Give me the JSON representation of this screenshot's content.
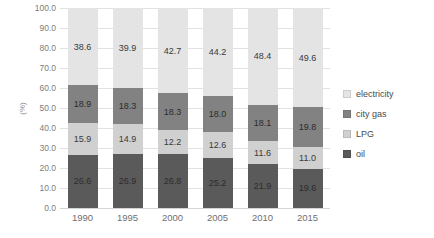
{
  "chart_data": {
    "type": "bar",
    "subtype": "stacked-bar-100",
    "title": "",
    "xlabel": "",
    "ylabel": "(%)",
    "ylim": [
      0,
      100
    ],
    "ytick_labels": [
      "0.0",
      "10.0",
      "20.0",
      "30.0",
      "40.0",
      "50.0",
      "60.0",
      "70.0",
      "80.0",
      "90.0",
      "100.0"
    ],
    "ytick_values": [
      0,
      10,
      20,
      30,
      40,
      50,
      60,
      70,
      80,
      90,
      100
    ],
    "grid": true,
    "legend_position": "right",
    "categories": [
      "1990",
      "1995",
      "2000",
      "2005",
      "2010",
      "2015"
    ],
    "series": [
      {
        "name": "electricity",
        "color": "#e4e4e4",
        "values": [
          38.6,
          39.9,
          42.7,
          44.2,
          48.4,
          49.6
        ],
        "labels": [
          "38.6",
          "39.9",
          "42.7",
          "44.2",
          "48.4",
          "49.6"
        ],
        "label_visible": [
          true,
          true,
          true,
          true,
          true,
          true
        ]
      },
      {
        "name": "city gas",
        "color": "#828282",
        "values": [
          18.9,
          18.3,
          18.3,
          18.0,
          18.1,
          19.8
        ],
        "labels": [
          "18.9",
          "18.3",
          "18.3",
          "18.0",
          "18.1",
          "19.8"
        ],
        "label_visible": [
          true,
          true,
          true,
          true,
          true,
          true
        ]
      },
      {
        "name": "LPG",
        "color": "#d0d0d0",
        "values": [
          15.9,
          14.9,
          12.2,
          12.6,
          11.6,
          11.0
        ],
        "labels": [
          "15.9",
          "14.9",
          "12.2",
          "12.6",
          "11.6",
          "11.0"
        ],
        "label_visible": [
          true,
          true,
          true,
          true,
          true,
          true
        ]
      },
      {
        "name": "oil",
        "color": "#5a5a5a",
        "values": [
          26.6,
          26.9,
          26.8,
          25.2,
          21.9,
          19.6
        ],
        "labels": [
          "26.6",
          "26.9",
          "26.8",
          "25.2",
          "21.9",
          "19.6"
        ],
        "label_visible": [
          true,
          true,
          true,
          true,
          true,
          true
        ]
      }
    ]
  },
  "legend": {
    "items": [
      {
        "label": "electricity",
        "color": "#e4e4e4"
      },
      {
        "label": "city gas",
        "color": "#828282"
      },
      {
        "label": "LPG",
        "color": "#d0d0d0"
      },
      {
        "label": "oil",
        "color": "#5a5a5a"
      }
    ]
  }
}
